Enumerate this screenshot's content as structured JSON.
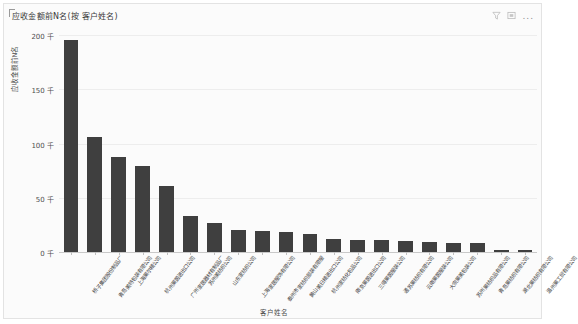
{
  "header": {
    "title": "应收金额前N名(按 客户姓名)",
    "icons": [
      {
        "name": "filter-icon",
        "glyph": "filter"
      },
      {
        "name": "focus-mode-icon",
        "glyph": "focus"
      },
      {
        "name": "more-options-icon",
        "glyph": "..."
      }
    ]
  },
  "chart_data": {
    "type": "bar",
    "title": "应收金额前N名(按 客户姓名)",
    "xlabel": "客户姓名",
    "ylabel": "应收金额前N名",
    "ylim": [
      0,
      200000
    ],
    "ytick_labels": [
      "0 千",
      "50 千",
      "100 千",
      "150 千",
      "200 千"
    ],
    "ytick_values": [
      0,
      50000,
      100000,
      150000,
      200000
    ],
    "grid": true,
    "legend": "none",
    "bar_color": "#3f3f3f",
    "categories": [
      "桥子集团股份制品厂",
      "青岛美特包装有限公司",
      "上海莱尔精公司",
      "杭州莱茵进出口公司",
      "广州家居器材有制品厂",
      "苏州美纺织公司",
      "山东家纺织公司",
      "上海家居服饰有限公司",
      "泰州市家纺织部装有限服",
      "黄山美日精进出口公司",
      "杭州家纺化包品公司",
      "南京莱茵进出口公司",
      "三得莱茵服装公司",
      "通苏莱纺织有限公司",
      "云南莱茵服装公司",
      "大宗莱美包装公司",
      "苏州莱纺织品有限公司",
      "青岛莱纺织有限公司",
      "湖北莱纺织有限公司",
      "温州莱工贸有限公司"
    ],
    "values": [
      195000,
      106000,
      88000,
      79000,
      61000,
      33000,
      27000,
      20000,
      19000,
      18000,
      17000,
      12000,
      11000,
      11000,
      10000,
      9000,
      8500,
      8000,
      2000,
      1500
    ]
  }
}
